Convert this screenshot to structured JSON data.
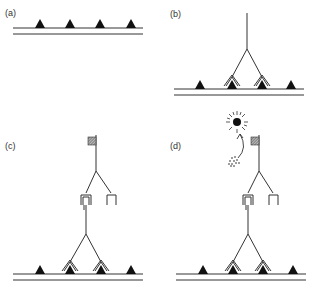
{
  "figure": {
    "panels": [
      {
        "id": "a",
        "label": "(a)",
        "description": "Membrane with receptors (triangles) only"
      },
      {
        "id": "b",
        "label": "(b)",
        "description": "Y-shaped molecule binding two adjacent receptors"
      },
      {
        "id": "c",
        "label": "(c)",
        "description": "Second Y-shaped molecule with flag tag binding the first"
      },
      {
        "id": "d",
        "label": "(d)",
        "description": "Tag labelled with substrate converted to signal (starburst)"
      }
    ],
    "colors": {
      "ink": "#1a1a1a",
      "line": "#333333",
      "background": "#ffffff"
    },
    "icons": {
      "receptor": "triangle-icon",
      "tag": "hatched-square-icon",
      "signal": "starburst-icon",
      "substrate": "dots-icon",
      "conversion": "curved-arrow-icon"
    }
  }
}
